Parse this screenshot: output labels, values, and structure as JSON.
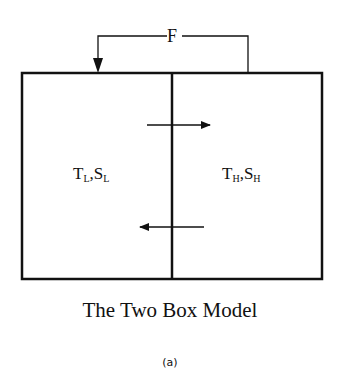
{
  "diagram": {
    "flux_label": "F",
    "left_box": {
      "t": "T",
      "t_sub": "L",
      "sep": ",",
      "s": "S",
      "s_sub": "L"
    },
    "right_box": {
      "t": "T",
      "t_sub": "H",
      "sep": ",",
      "s": "S",
      "s_sub": "H"
    },
    "title": "The Two Box Model",
    "panel_label": "(a)"
  }
}
